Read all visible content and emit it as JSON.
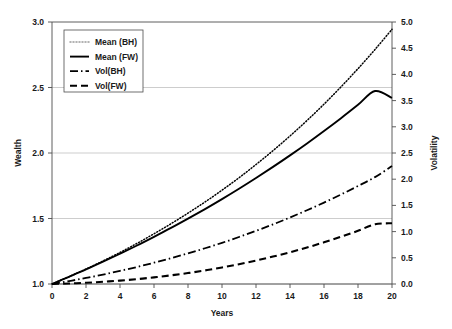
{
  "chart_data": {
    "type": "line",
    "title": "",
    "xlabel": "Years",
    "ylabel": "Wealth",
    "y2label": "Volatility",
    "grid": true,
    "legend_position": "top-left",
    "xlim": [
      0,
      20
    ],
    "ylim": [
      1.0,
      3.0
    ],
    "y2lim": [
      0.0,
      5.0
    ],
    "xticks": [
      0,
      2,
      4,
      6,
      8,
      10,
      12,
      14,
      16,
      18,
      20
    ],
    "xtick_labels": [
      "0",
      "2",
      "4",
      "6",
      "8",
      "10",
      "12",
      "14",
      "16",
      "18",
      "20"
    ],
    "yticks": [
      1.0,
      1.5,
      2.0,
      2.5,
      3.0
    ],
    "ytick_labels": [
      "1.0",
      "1.5",
      "2.0",
      "2.5",
      "3.0"
    ],
    "y2ticks": [
      0.0,
      0.5,
      1.0,
      1.5,
      2.0,
      2.5,
      3.0,
      3.5,
      4.0,
      4.5,
      5.0
    ],
    "y2tick_labels": [
      "0.0",
      "0.5",
      "1.0",
      "1.5",
      "2.0",
      "2.5",
      "3.0",
      "3.5",
      "4.0",
      "4.5",
      "5.0"
    ],
    "x": [
      0,
      1,
      2,
      3,
      4,
      5,
      6,
      7,
      8,
      9,
      10,
      11,
      12,
      13,
      14,
      15,
      16,
      17,
      18,
      19,
      20
    ],
    "series": [
      {
        "name": "Mean (BH)",
        "axis": "left",
        "style": "dotted",
        "color": "#808080",
        "values": [
          1.0,
          1.056,
          1.114,
          1.176,
          1.241,
          1.31,
          1.383,
          1.46,
          1.541,
          1.626,
          1.716,
          1.811,
          1.912,
          2.018,
          2.13,
          2.248,
          2.373,
          2.505,
          2.644,
          2.79,
          2.944
        ]
      },
      {
        "name": "Mean (FW)",
        "axis": "left",
        "style": "solid",
        "color": "#000000",
        "values": [
          1.0,
          1.055,
          1.111,
          1.17,
          1.231,
          1.294,
          1.36,
          1.428,
          1.499,
          1.572,
          1.648,
          1.727,
          1.809,
          1.894,
          1.982,
          2.073,
          2.168,
          2.266,
          2.368,
          2.473,
          2.42
        ]
      },
      {
        "name": "Vol(BH)",
        "axis": "right",
        "style": "dashdot",
        "color": "#000000",
        "values": [
          0.0,
          0.055,
          0.115,
          0.18,
          0.25,
          0.325,
          0.406,
          0.492,
          0.584,
          0.682,
          0.786,
          0.897,
          1.014,
          1.138,
          1.269,
          1.408,
          1.554,
          1.708,
          1.87,
          2.04,
          2.25
        ]
      },
      {
        "name": "Vol(FW)",
        "axis": "right",
        "style": "dashed",
        "color": "#000000",
        "values": [
          0.0,
          0.01,
          0.024,
          0.042,
          0.065,
          0.093,
          0.126,
          0.165,
          0.209,
          0.259,
          0.315,
          0.378,
          0.447,
          0.523,
          0.606,
          0.697,
          0.795,
          0.901,
          1.016,
          1.139,
          1.16
        ]
      }
    ]
  },
  "axes": {
    "y_left_title": "Wealth",
    "y_right_title": "Volatility",
    "x_title": "Years"
  },
  "legend": {
    "entries": [
      {
        "label": "Mean (BH)",
        "style": "dotted"
      },
      {
        "label": "Mean (FW)",
        "style": "solid"
      },
      {
        "label": "Vol(BH)",
        "style": "dashdot"
      },
      {
        "label": "Vol(FW)",
        "style": "dashed"
      }
    ]
  }
}
